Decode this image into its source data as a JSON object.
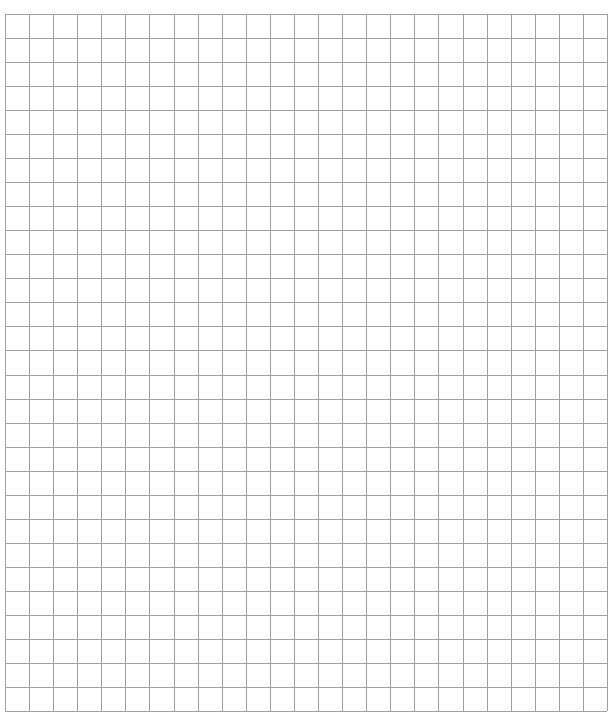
{
  "grid": {
    "columns": 25,
    "rows": 29,
    "left": 5,
    "top": 14,
    "right": 607,
    "bottom": 711,
    "line_color": "#a0a0a0",
    "background": "#ffffff"
  }
}
